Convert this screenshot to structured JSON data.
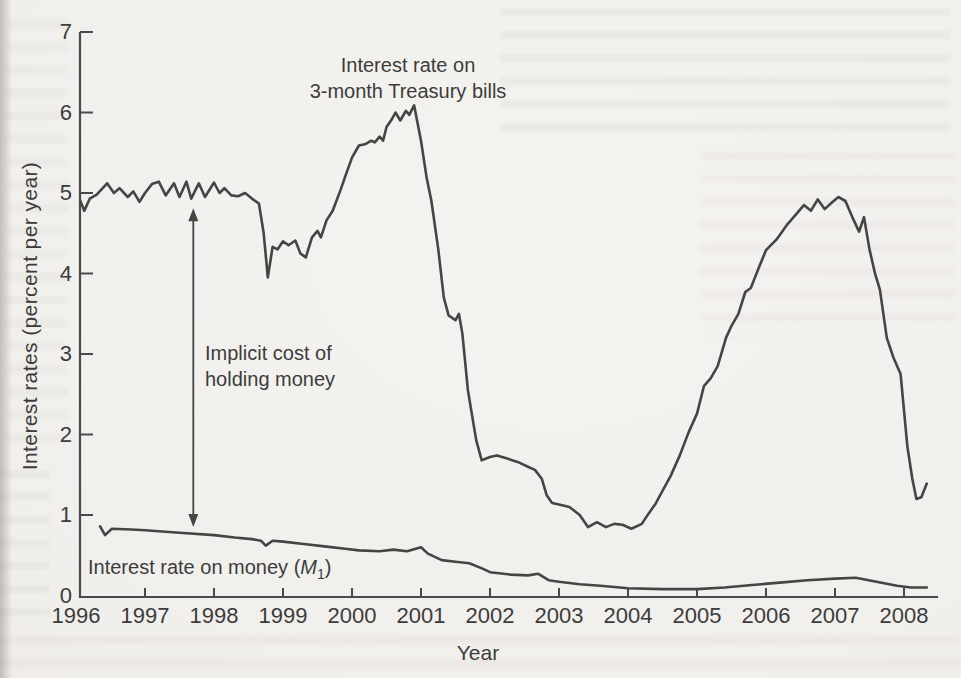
{
  "figure": {
    "y_axis_title": "Interest rates (percent per year)",
    "x_axis_title": "Year",
    "treasury_label_line1": "Interest rate on",
    "treasury_label_line2": "3-month Treasury bills",
    "annotation_line1": "Implicit cost of",
    "annotation_line2": "holding money",
    "m1_label": {
      "prefix": "Interest rate on money (",
      "symbol": "M",
      "subscript": "1",
      "suffix": ")"
    }
  },
  "colors": {
    "line": "#454545",
    "axis": "#4a4a4a",
    "text": "#3c3c3c",
    "paper": "#f1efeb"
  },
  "chart_data": {
    "type": "line",
    "title": "",
    "xlabel": "Year",
    "ylabel": "Interest rates (percent per year)",
    "xlim": [
      1996,
      2008.6
    ],
    "ylim": [
      0,
      7
    ],
    "grid": false,
    "legend_position": "inline-annotations",
    "y_tick_values": [
      0,
      1,
      2,
      3,
      4,
      5,
      6,
      7
    ],
    "x_tick_values": [
      1996,
      1997,
      1998,
      1999,
      2000,
      2001,
      2002,
      2003,
      2004,
      2005,
      2006,
      2007,
      2008
    ],
    "series": [
      {
        "name": "Interest rate on 3-month Treasury bills",
        "x": [
          1996.06,
          1996.12,
          1996.2,
          1996.3,
          1996.45,
          1996.55,
          1996.63,
          1996.75,
          1996.83,
          1996.92,
          1997.0,
          1997.1,
          1997.2,
          1997.3,
          1997.42,
          1997.5,
          1997.6,
          1997.67,
          1997.78,
          1997.87,
          1998.0,
          1998.08,
          1998.15,
          1998.25,
          1998.35,
          1998.45,
          1998.55,
          1998.65,
          1998.72,
          1998.78,
          1998.85,
          1998.92,
          1999.0,
          1999.08,
          1999.18,
          1999.25,
          1999.33,
          1999.42,
          1999.5,
          1999.55,
          1999.63,
          1999.72,
          1999.83,
          1999.92,
          2000.0,
          2000.1,
          2000.2,
          2000.28,
          2000.33,
          2000.4,
          2000.45,
          2000.5,
          2000.58,
          2000.63,
          2000.7,
          2000.78,
          2000.83,
          2000.9,
          2001.0,
          2001.08,
          2001.15,
          2001.25,
          2001.33,
          2001.4,
          2001.5,
          2001.55,
          2001.6,
          2001.68,
          2001.8,
          2001.88,
          2002.0,
          2002.1,
          2002.25,
          2002.4,
          2002.55,
          2002.65,
          2002.75,
          2002.82,
          2002.9,
          2003.0,
          2003.15,
          2003.3,
          2003.42,
          2003.55,
          2003.68,
          2003.8,
          2003.92,
          2004.05,
          2004.2,
          2004.3,
          2004.4,
          2004.5,
          2004.62,
          2004.75,
          2004.88,
          2005.0,
          2005.1,
          2005.2,
          2005.3,
          2005.42,
          2005.5,
          2005.6,
          2005.7,
          2005.78,
          2005.9,
          2006.0,
          2006.15,
          2006.3,
          2006.45,
          2006.55,
          2006.65,
          2006.75,
          2006.85,
          2006.95,
          2007.05,
          2007.15,
          2007.25,
          2007.35,
          2007.42,
          2007.5,
          2007.58,
          2007.65,
          2007.75,
          2007.85,
          2007.95,
          2008.0,
          2008.05,
          2008.12,
          2008.18,
          2008.25,
          2008.33
        ],
        "y": [
          4.91,
          4.78,
          4.93,
          4.98,
          5.12,
          5.0,
          5.06,
          4.95,
          5.02,
          4.89,
          5.0,
          5.11,
          5.14,
          4.97,
          5.12,
          4.95,
          5.14,
          4.93,
          5.12,
          4.95,
          5.13,
          5.0,
          5.06,
          4.97,
          4.96,
          5.0,
          4.93,
          4.87,
          4.5,
          3.95,
          4.33,
          4.3,
          4.4,
          4.35,
          4.41,
          4.25,
          4.2,
          4.45,
          4.53,
          4.45,
          4.66,
          4.78,
          5.03,
          5.25,
          5.44,
          5.59,
          5.61,
          5.65,
          5.63,
          5.7,
          5.65,
          5.82,
          5.92,
          6.0,
          5.9,
          6.02,
          5.97,
          6.09,
          5.65,
          5.2,
          4.9,
          4.3,
          3.7,
          3.48,
          3.42,
          3.5,
          3.25,
          2.55,
          1.93,
          1.68,
          1.72,
          1.74,
          1.7,
          1.66,
          1.6,
          1.56,
          1.45,
          1.25,
          1.15,
          1.13,
          1.1,
          1.0,
          0.85,
          0.91,
          0.85,
          0.89,
          0.88,
          0.83,
          0.89,
          1.02,
          1.14,
          1.3,
          1.49,
          1.74,
          2.03,
          2.26,
          2.6,
          2.7,
          2.85,
          3.2,
          3.35,
          3.5,
          3.77,
          3.82,
          4.08,
          4.29,
          4.42,
          4.6,
          4.75,
          4.85,
          4.78,
          4.92,
          4.8,
          4.88,
          4.95,
          4.9,
          4.7,
          4.52,
          4.7,
          4.3,
          4.0,
          3.8,
          3.2,
          2.95,
          2.75,
          2.3,
          1.85,
          1.45,
          1.2,
          1.22,
          1.39
        ]
      },
      {
        "name": "Interest rate on money (M1)",
        "x": [
          1996.35,
          1996.42,
          1996.52,
          1996.8,
          1997.0,
          1997.5,
          1998.0,
          1998.3,
          1998.55,
          1998.68,
          1998.75,
          1998.85,
          1999.0,
          1999.3,
          1999.6,
          1999.9,
          2000.1,
          2000.4,
          2000.6,
          2000.8,
          2001.0,
          2001.1,
          2001.3,
          2001.5,
          2001.7,
          2001.9,
          2002.0,
          2002.3,
          2002.55,
          2002.7,
          2002.85,
          2003.0,
          2003.3,
          2003.6,
          2004.0,
          2004.5,
          2005.0,
          2005.4,
          2005.8,
          2006.2,
          2006.6,
          2007.0,
          2007.3,
          2007.6,
          2007.9,
          2008.1,
          2008.33
        ],
        "y": [
          0.86,
          0.75,
          0.83,
          0.82,
          0.81,
          0.78,
          0.75,
          0.72,
          0.7,
          0.68,
          0.62,
          0.68,
          0.67,
          0.64,
          0.61,
          0.58,
          0.56,
          0.55,
          0.57,
          0.55,
          0.6,
          0.52,
          0.44,
          0.42,
          0.4,
          0.33,
          0.29,
          0.26,
          0.25,
          0.27,
          0.19,
          0.17,
          0.14,
          0.12,
          0.09,
          0.08,
          0.08,
          0.1,
          0.13,
          0.16,
          0.19,
          0.21,
          0.22,
          0.17,
          0.12,
          0.1,
          0.1
        ]
      }
    ],
    "annotations": [
      {
        "text": "Implicit cost of holding money",
        "type": "double-headed-arrow",
        "x": 1997.7,
        "y_from": 0.85,
        "y_to": 4.81
      },
      {
        "text": "Interest rate on 3-month Treasury bills",
        "type": "series-label",
        "x": 2000.8,
        "y": 6.6
      },
      {
        "text": "Interest rate on money (M1)",
        "type": "series-label",
        "x": 1997.6,
        "y": 0.35
      }
    ]
  }
}
